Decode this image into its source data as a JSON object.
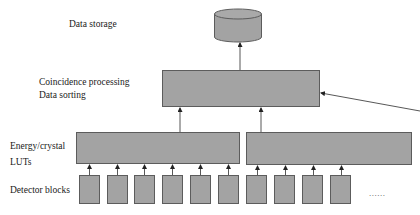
{
  "diagram": {
    "labels": {
      "data_storage": "Data storage",
      "coincidence_line1": "Coincidence processing",
      "coincidence_line2": "Data sorting",
      "energy_line1": "Energy/crystal",
      "energy_line2": "LUTs",
      "detector_blocks": "Detector blocks",
      "ellipsis": "......"
    },
    "colors": {
      "box_fill": "#a3a3a3",
      "box_border": "#5c5c5c",
      "line": "#333333"
    },
    "nodes": {
      "storage": {
        "type": "cylinder",
        "x": 214,
        "y": 9,
        "w": 48,
        "h": 33
      },
      "coincidence": {
        "type": "rect",
        "x": 162,
        "y": 70,
        "w": 158,
        "h": 37
      },
      "lut_left": {
        "type": "rect",
        "x": 76,
        "y": 132,
        "w": 164,
        "h": 32
      },
      "lut_right": {
        "type": "rect",
        "x": 246,
        "y": 132,
        "w": 166,
        "h": 33
      },
      "detector_blocks": [
        {
          "x": 79,
          "y": 175,
          "w": 21,
          "h": 29
        },
        {
          "x": 107,
          "y": 175,
          "w": 21,
          "h": 29
        },
        {
          "x": 134,
          "y": 175,
          "w": 21,
          "h": 29
        },
        {
          "x": 162,
          "y": 175,
          "w": 21,
          "h": 29
        },
        {
          "x": 190,
          "y": 175,
          "w": 21,
          "h": 29
        },
        {
          "x": 218,
          "y": 175,
          "w": 21,
          "h": 29
        },
        {
          "x": 246,
          "y": 175,
          "w": 21,
          "h": 29
        },
        {
          "x": 274,
          "y": 175,
          "w": 21,
          "h": 29
        },
        {
          "x": 302,
          "y": 175,
          "w": 21,
          "h": 29
        },
        {
          "x": 330,
          "y": 175,
          "w": 21,
          "h": 29
        }
      ]
    }
  }
}
